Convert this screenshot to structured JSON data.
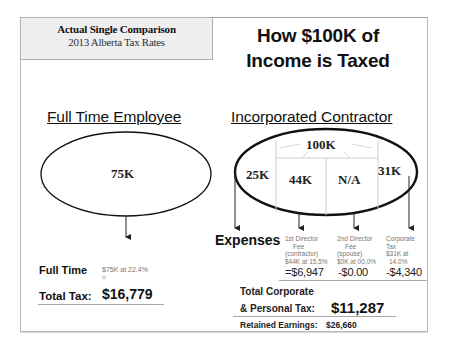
{
  "caption": {
    "title": "Actual Single Comparison",
    "subtitle": "2013 Alberta Tax Rates"
  },
  "main_title": {
    "line1": "How $100K of",
    "line2": "Income is Taxed"
  },
  "employee": {
    "heading": "Full Time Employee",
    "oval_value": "75K",
    "label_line1": "Full Time",
    "label_line2": "Total Tax:",
    "calc_note": "$75K at 22.4%",
    "calc_equals": "=",
    "total_tax": "$16,779"
  },
  "contractor": {
    "heading": "Incorporated Contractor",
    "oval_total": "100K",
    "segments": [
      {
        "value": "25K"
      },
      {
        "value": "44K"
      },
      {
        "value": "N/A"
      },
      {
        "value": "31K"
      }
    ],
    "expenses_label": "Expenses",
    "expense_columns": [
      {
        "lines": [
          "1st Director",
          "Fee",
          "(contractor)",
          "$44K at 15.5%"
        ],
        "amount": "=$6,947"
      },
      {
        "lines": [
          "2nd Director",
          "Fee",
          "(spouse)",
          "$0K at 00.0%"
        ],
        "amount": "-$0.00"
      },
      {
        "lines": [
          "Corporate",
          "Tax",
          "$31K at",
          "14.0%"
        ],
        "amount": "-$4,340"
      }
    ],
    "total_label_line1": "Total Corporate",
    "total_label_line2": "& Personal Tax:",
    "total_tax": "$11,287",
    "retained_label": "Retained Earnings:",
    "retained_value": "$26,660"
  }
}
